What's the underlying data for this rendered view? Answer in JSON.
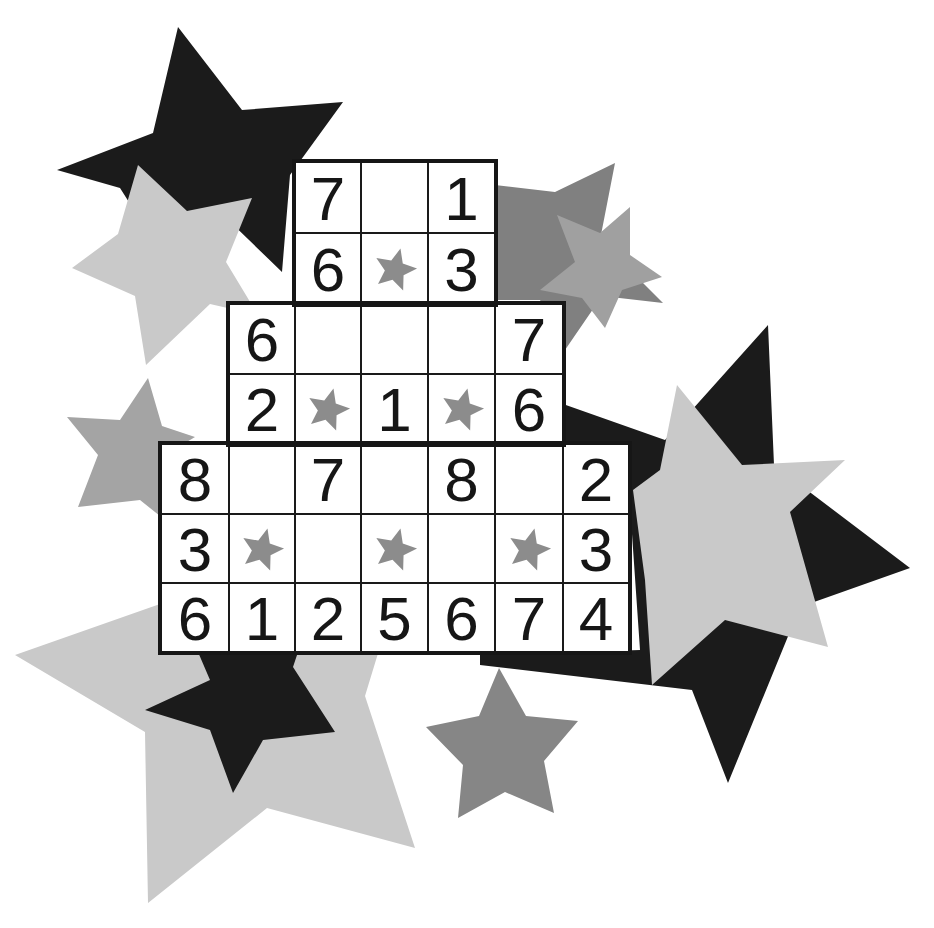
{
  "puzzle": {
    "type": "star-sum-pyramid",
    "colors": {
      "grid_line": "#1a1a1a",
      "digit": "#161616",
      "cell_bg": "#ffffff",
      "marker_star": "#8c8c8c",
      "star_black": "#1b1b1b",
      "star_dark_gray": "#7f7f7f",
      "star_mid_gray": "#9d9d9d",
      "star_light_gray": "#c9c9c9"
    },
    "column_x": [
      161,
      229,
      295,
      361,
      428,
      495,
      563,
      629
    ],
    "row_y": [
      162,
      233,
      304,
      374,
      444,
      514,
      583,
      652
    ],
    "rows": [
      {
        "cells": [
          {
            "col": 2,
            "value": "7"
          },
          {
            "col": 3,
            "value": ""
          },
          {
            "col": 4,
            "value": "1"
          }
        ]
      },
      {
        "cells": [
          {
            "col": 2,
            "value": "6"
          },
          {
            "col": 3,
            "value": "",
            "star": true
          },
          {
            "col": 4,
            "value": "3"
          }
        ]
      },
      {
        "cells": [
          {
            "col": 1,
            "value": "6"
          },
          {
            "col": 2,
            "value": ""
          },
          {
            "col": 3,
            "value": ""
          },
          {
            "col": 4,
            "value": ""
          },
          {
            "col": 5,
            "value": "7"
          }
        ]
      },
      {
        "cells": [
          {
            "col": 1,
            "value": "2"
          },
          {
            "col": 2,
            "value": "",
            "star": true
          },
          {
            "col": 3,
            "value": "1"
          },
          {
            "col": 4,
            "value": "",
            "star": true
          },
          {
            "col": 5,
            "value": "6"
          }
        ]
      },
      {
        "cells": [
          {
            "col": 0,
            "value": "8"
          },
          {
            "col": 1,
            "value": ""
          },
          {
            "col": 2,
            "value": "7"
          },
          {
            "col": 3,
            "value": ""
          },
          {
            "col": 4,
            "value": "8"
          },
          {
            "col": 5,
            "value": ""
          },
          {
            "col": 6,
            "value": "2"
          }
        ]
      },
      {
        "cells": [
          {
            "col": 0,
            "value": "3"
          },
          {
            "col": 1,
            "value": "",
            "star": true
          },
          {
            "col": 2,
            "value": ""
          },
          {
            "col": 3,
            "value": "",
            "star": true
          },
          {
            "col": 4,
            "value": ""
          },
          {
            "col": 5,
            "value": "",
            "star": true
          },
          {
            "col": 6,
            "value": "3"
          }
        ]
      },
      {
        "cells": [
          {
            "col": 0,
            "value": "6"
          },
          {
            "col": 1,
            "value": "1"
          },
          {
            "col": 2,
            "value": "2"
          },
          {
            "col": 3,
            "value": "5"
          },
          {
            "col": 4,
            "value": "6"
          },
          {
            "col": 5,
            "value": "7"
          },
          {
            "col": 6,
            "value": "4"
          }
        ]
      }
    ]
  },
  "background_stars": [
    {
      "name": "star-black-top-left",
      "color": "#1b1b1b",
      "points": "178,27 242,110 343,102 290,175 282,272 220,212 153,240 120,188 57,170 153,133"
    },
    {
      "name": "star-light-gray-top-left",
      "color": "#c9c9c9",
      "points": "138,165 187,211 252,198 226,262 258,315 210,304 146,365 135,296 72,268 118,234"
    },
    {
      "name": "star-dark-gray-top-right",
      "color": "#808080",
      "points": "495,185 555,192 615,163 600,240 663,303 602,296 565,350 540,300 495,300"
    },
    {
      "name": "star-mid-gray-top-right",
      "color": "#a0a0a0",
      "points": "557,215 600,233 630,207 630,255 662,277 622,290 605,328 582,298 540,290 575,262"
    },
    {
      "name": "star-gray-left",
      "color": "#a4a4a4",
      "points": "148,378 162,426 195,437 165,455 165,520 140,500 78,507 98,455 67,417 120,420"
    },
    {
      "name": "star-light-gray-bottom-left",
      "color": "#c9c9c9",
      "points": "15,655 160,604 300,604 390,614 365,696 415,848 267,808 148,903 145,732"
    },
    {
      "name": "star-black-bottom-left",
      "color": "#1b1b1b",
      "points": "198,652 298,652 293,667 335,732 263,740 233,793 210,730 145,710 210,680"
    },
    {
      "name": "star-black-right",
      "color": "#1b1b1b",
      "points": "768,325 774,465 910,568 800,607 728,783 692,690 480,665 480,655 640,650 630,505 563,470 563,404 665,440"
    },
    {
      "name": "star-light-gray-right",
      "color": "#c9c9c9",
      "points": "677,385 742,465 845,460 790,512 828,647 725,620 652,685 645,580 633,490 660,470"
    },
    {
      "name": "star-gray-bottom-center",
      "color": "#868686",
      "points": "499,668 526,716 578,721 544,761 554,813 505,792 458,818 463,765 426,727 479,716"
    }
  ]
}
